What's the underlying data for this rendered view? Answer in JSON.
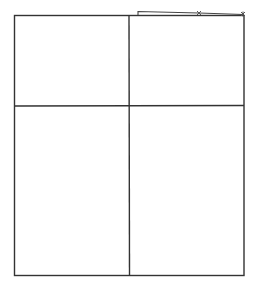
{
  "diagram": {
    "type": "grid",
    "rows": 2,
    "columns": 2,
    "line_color": "#333333",
    "background": "#ffffff",
    "outer_box": {
      "x": 14,
      "y": 15,
      "width": 230,
      "height": 261
    },
    "vertical_divider_x": 129,
    "horizontal_divider_y": 106,
    "cells": [
      {
        "row": 0,
        "col": 0,
        "label": ""
      },
      {
        "row": 0,
        "col": 1,
        "label": ""
      },
      {
        "row": 1,
        "col": 0,
        "label": ""
      },
      {
        "row": 1,
        "col": 1,
        "label": ""
      }
    ],
    "annotation_stroke": {
      "points": [
        [
          138,
          15
        ],
        [
          138,
          11
        ],
        [
          199,
          13
        ],
        [
          243,
          14
        ]
      ],
      "marks": [
        [
          199,
          13
        ],
        [
          243,
          14
        ]
      ],
      "color": "#444444"
    }
  }
}
